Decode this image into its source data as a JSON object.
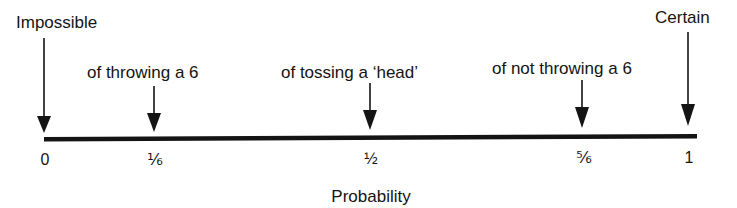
{
  "diagram": {
    "axis_label": "Probability",
    "ends": {
      "left": "Impossible",
      "right": "Certain"
    },
    "markers": [
      {
        "value": "0",
        "position": 0,
        "label": "Impossible"
      },
      {
        "value": "⅙",
        "position": 0.1667,
        "label": "of throwing a 6"
      },
      {
        "value": "½",
        "position": 0.5,
        "label": "of tossing a ‘head’"
      },
      {
        "value": "⅚",
        "position": 0.8333,
        "label": "of not throwing a 6"
      },
      {
        "value": "1",
        "position": 1,
        "label": "Certain"
      }
    ],
    "colors": {
      "line": "#141414",
      "background": "#ffffff"
    }
  }
}
